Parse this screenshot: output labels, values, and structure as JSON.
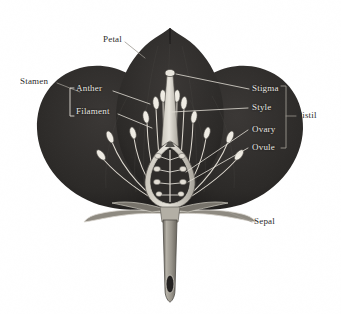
{
  "diagram": {
    "style": "vintage engraving",
    "background_color": "#ffffff",
    "petal_color": "#302d2c",
    "petal_color_dark": "#211f1f",
    "line_color": "#d9d6cf",
    "stem_color": "#9a968d",
    "label_dark_color": "#2b2b2b",
    "label_light_color": "#e9e7e2"
  },
  "labels": {
    "petal": "Petal",
    "stamen": "Stamen",
    "anther": "Anther",
    "filament": "Filament",
    "stigma": "Stigma",
    "style": "Style",
    "ovary": "Ovary",
    "ovule": "Ovule",
    "pistil": "Pistil",
    "sepal": "Sepal"
  },
  "groups": {
    "stamen_parts": [
      "Anther",
      "Filament"
    ],
    "pistil_parts": [
      "Stigma",
      "Style",
      "Ovary",
      "Ovule"
    ]
  },
  "structure": {
    "petal_count": 3,
    "sepal_count": 4,
    "stamen_count": 12,
    "ovule_count": 8
  }
}
